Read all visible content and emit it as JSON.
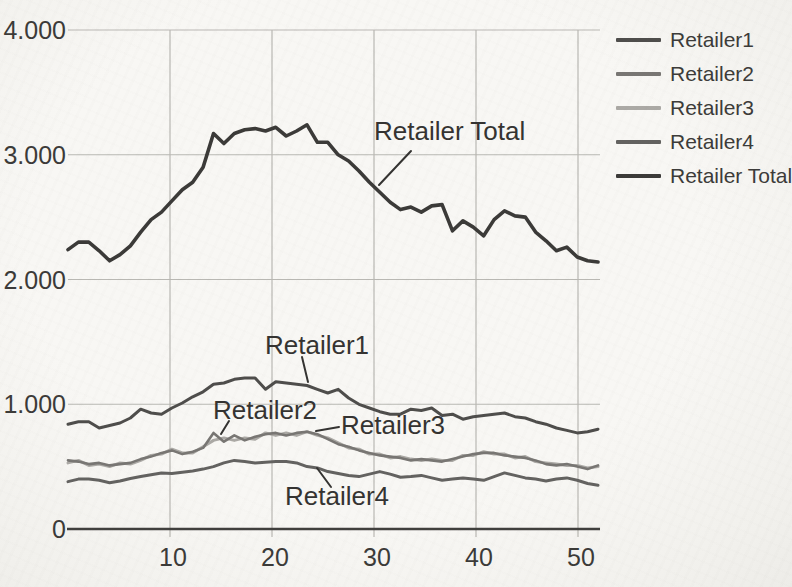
{
  "chart_data": {
    "type": "line",
    "title": "",
    "xlabel": "",
    "ylabel": "",
    "xlim": [
      1,
      52
    ],
    "ylim": [
      0,
      4000
    ],
    "grid": true,
    "legend_position": "right",
    "x": [
      1,
      2,
      3,
      4,
      5,
      6,
      7,
      8,
      9,
      10,
      11,
      12,
      13,
      14,
      15,
      16,
      17,
      18,
      19,
      20,
      21,
      22,
      23,
      24,
      25,
      26,
      27,
      28,
      29,
      30,
      31,
      32,
      33,
      34,
      35,
      36,
      37,
      38,
      39,
      40,
      41,
      42,
      43,
      44,
      45,
      46,
      47,
      48,
      49,
      50,
      51,
      52
    ],
    "xticks": [
      {
        "value": 10,
        "label": "10"
      },
      {
        "value": 20,
        "label": "20"
      },
      {
        "value": 30,
        "label": "30"
      },
      {
        "value": 40,
        "label": "40"
      },
      {
        "value": 50,
        "label": "50"
      }
    ],
    "yticks": [
      {
        "value": 0,
        "label": "0"
      },
      {
        "value": 1000,
        "label": "1.000"
      },
      {
        "value": 2000,
        "label": "2.000"
      },
      {
        "value": 3000,
        "label": "3.000"
      },
      {
        "value": 4000,
        "label": "4.000"
      }
    ],
    "series": [
      {
        "name": "Retailer1",
        "color": "#4e4d4b",
        "width": 3,
        "values": [
          840,
          860,
          860,
          810,
          830,
          850,
          890,
          960,
          930,
          920,
          970,
          1010,
          1060,
          1100,
          1160,
          1170,
          1200,
          1210,
          1210,
          1120,
          1180,
          1170,
          1160,
          1150,
          1120,
          1090,
          1120,
          1050,
          1000,
          970,
          940,
          920,
          920,
          960,
          950,
          970,
          910,
          920,
          880,
          900,
          910,
          920,
          930,
          900,
          890,
          860,
          840,
          810,
          790,
          770,
          780,
          800
        ]
      },
      {
        "name": "Retailer2",
        "color": "#787673",
        "width": 2.6,
        "values": [
          550,
          540,
          520,
          530,
          510,
          520,
          530,
          560,
          580,
          610,
          630,
          600,
          620,
          650,
          770,
          700,
          750,
          710,
          740,
          760,
          770,
          750,
          770,
          780,
          760,
          720,
          680,
          660,
          630,
          610,
          590,
          580,
          570,
          550,
          560,
          550,
          540,
          560,
          580,
          600,
          610,
          610,
          590,
          580,
          570,
          550,
          520,
          510,
          520,
          500,
          480,
          510
        ]
      },
      {
        "name": "Retailer3",
        "color": "#aba9a5",
        "width": 3,
        "values": [
          530,
          550,
          510,
          520,
          500,
          530,
          520,
          550,
          590,
          600,
          640,
          610,
          610,
          660,
          710,
          730,
          710,
          730,
          720,
          770,
          750,
          770,
          750,
          780,
          750,
          730,
          690,
          650,
          640,
          600,
          600,
          570,
          580,
          560,
          550,
          560,
          550,
          550,
          590,
          590,
          620,
          600,
          600,
          570,
          580,
          540,
          530,
          520,
          510,
          510,
          490,
          500
        ]
      },
      {
        "name": "Retailer4",
        "color": "#636260",
        "width": 3,
        "values": [
          380,
          400,
          400,
          390,
          370,
          385,
          405,
          420,
          435,
          450,
          445,
          455,
          465,
          480,
          500,
          530,
          550,
          540,
          530,
          535,
          540,
          540,
          530,
          500,
          490,
          460,
          445,
          430,
          420,
          440,
          460,
          440,
          415,
          420,
          430,
          410,
          390,
          400,
          410,
          400,
          390,
          420,
          450,
          430,
          410,
          400,
          385,
          400,
          410,
          390,
          365,
          350
        ]
      },
      {
        "name": "Retailer Total",
        "color": "#3b3a38",
        "width": 3.6,
        "values": [
          2240,
          2300,
          2300,
          2230,
          2150,
          2200,
          2270,
          2380,
          2480,
          2540,
          2630,
          2720,
          2780,
          2900,
          3170,
          3090,
          3170,
          3200,
          3210,
          3190,
          3220,
          3150,
          3190,
          3240,
          3100,
          3100,
          3000,
          2950,
          2870,
          2780,
          2700,
          2620,
          2560,
          2580,
          2540,
          2590,
          2600,
          2390,
          2470,
          2420,
          2350,
          2480,
          2550,
          2510,
          2500,
          2380,
          2310,
          2230,
          2260,
          2180,
          2150,
          2140
        ]
      }
    ],
    "annotations": [
      {
        "text": "Retailer Total",
        "text_x": 374,
        "text_y": 118,
        "leader": [
          [
            411,
            151
          ],
          [
            379,
            185
          ]
        ]
      },
      {
        "text": "Retailer1",
        "text_x": 265,
        "text_y": 332,
        "leader": [
          [
            302,
            357
          ],
          [
            308,
            382
          ]
        ]
      },
      {
        "text": "Retailer2",
        "text_x": 213,
        "text_y": 397,
        "leader": [
          [
            229,
            421
          ],
          [
            221,
            434
          ]
        ]
      },
      {
        "text": "Retailer3",
        "text_x": 341,
        "text_y": 412,
        "leader": [
          [
            339,
            427
          ],
          [
            316,
            431
          ]
        ]
      },
      {
        "text": "Retailer4",
        "text_x": 285,
        "text_y": 483,
        "leader": [
          [
            331,
            487
          ],
          [
            317,
            468
          ]
        ]
      }
    ],
    "colors": {
      "grid": "#b9b8b3",
      "axis": "#403f3d",
      "tick_text": "#3b3a38",
      "annotation_text": "#343331",
      "paper": "#f6f5f2"
    }
  }
}
